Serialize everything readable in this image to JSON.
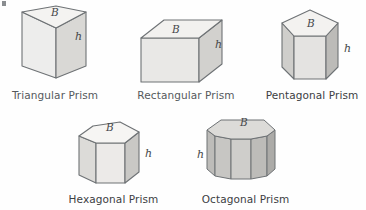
{
  "figure": {
    "background_color": "#fefefe",
    "label_color": "#55595c",
    "outline_color": "#6e7275",
    "variable_labels": {
      "base": "B",
      "height": "h"
    },
    "shapes": [
      {
        "id": "triangular-prism",
        "label": "Triangular Prism",
        "sides": 3,
        "base_label": "B",
        "height_label": "h",
        "fill_light": "#ededec",
        "fill_mid": "#e2e1df",
        "fill_dark": "#d6d5d2",
        "fill_top": "#f4f3f1"
      },
      {
        "id": "rectangular-prism",
        "label": "Rectangular Prism",
        "sides": 4,
        "base_label": "B",
        "height_label": "h",
        "fill_light": "#e9e8e6",
        "fill_mid": "#dedddb",
        "fill_dark": "#d2d1ce",
        "fill_top": "#f2f1ef"
      },
      {
        "id": "pentagonal-prism",
        "label": "Pentagonal Prism",
        "sides": 5,
        "base_label": "B",
        "height_label": "h",
        "fill_light": "#e4e3e1",
        "fill_mid": "#cfcecb",
        "fill_dark": "#bcbbb8",
        "fill_top": "#f3f2f0"
      },
      {
        "id": "hexagonal-prism",
        "label": "Hexagonal Prism",
        "sides": 6,
        "base_label": "B",
        "height_label": "h",
        "fill_light": "#eceae8",
        "fill_mid": "#dcdbd8",
        "fill_dark": "#c9c8c5",
        "fill_top": "#f6f5f3"
      },
      {
        "id": "octagonal-prism",
        "label": "Octagonal Prism",
        "sides": 8,
        "base_label": "B",
        "height_label": "h",
        "fill_light": "#cfcecb",
        "fill_mid": "#bdbcb9",
        "fill_dark": "#acaba8",
        "fill_top": "#dcdbd8"
      }
    ]
  }
}
